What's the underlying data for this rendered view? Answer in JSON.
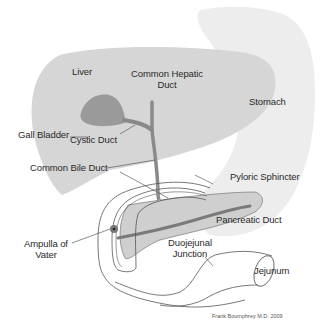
{
  "diagram": {
    "labels": {
      "liver": "Liver",
      "gall_bladder": "Gall Bladder",
      "common_hepatic_duct_line1": "Common Hepatic",
      "common_hepatic_duct_line2": "Duct",
      "cystic_duct": "Cystic Duct",
      "stomach": "Stomach",
      "common_bile_duct": "Common Bile Duct",
      "pyloric_sphincter": "Pyloric Sphincter",
      "pancreatic_duct": "Pancreatic Duct",
      "ampulla_line1": "Ampulla of",
      "ampulla_line2": "Vater",
      "duodejunal_line1": "Duojejunal",
      "duodejunal_line2": "Junction",
      "jejunum": "Jejunum"
    },
    "credit": "Frank Boumphrey M.D. 2009",
    "colors": {
      "liver": "#d6d6d6",
      "stomach": "#ededed",
      "gall_bladder": "#9a9a9a",
      "pancreas": "#cfcfcf",
      "duct": "#8a8a8a",
      "outline": "#555555",
      "text": "#2a2a2a"
    }
  }
}
